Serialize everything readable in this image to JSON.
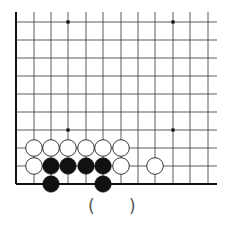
{
  "diagram": {
    "type": "go-board-problem",
    "grid": {
      "columns": 12,
      "rows": 10,
      "x_positions": [
        16,
        34,
        51,
        68,
        86,
        103,
        121,
        138,
        155,
        173,
        190,
        208
      ],
      "y_positions": [
        22,
        40,
        58,
        76,
        94,
        112,
        130,
        148,
        166,
        184
      ],
      "line_extend_right": 217,
      "line_extend_top": 12,
      "left_edge_border": true,
      "bottom_edge_border": true,
      "line_color": "#333333",
      "border_color": "#111111"
    },
    "star_points": [
      {
        "col": 3,
        "row": 0
      },
      {
        "col": 9,
        "row": 0
      },
      {
        "col": 3,
        "row": 6
      },
      {
        "col": 9,
        "row": 6
      }
    ],
    "stones": [
      {
        "color": "white",
        "col": 1,
        "row": 7
      },
      {
        "color": "white",
        "col": 2,
        "row": 7
      },
      {
        "color": "white",
        "col": 3,
        "row": 7
      },
      {
        "color": "white",
        "col": 4,
        "row": 7
      },
      {
        "color": "white",
        "col": 5,
        "row": 7
      },
      {
        "color": "white",
        "col": 6,
        "row": 7
      },
      {
        "color": "white",
        "col": 1,
        "row": 8
      },
      {
        "color": "black",
        "col": 2,
        "row": 8
      },
      {
        "color": "black",
        "col": 3,
        "row": 8
      },
      {
        "color": "black",
        "col": 4,
        "row": 8
      },
      {
        "color": "black",
        "col": 5,
        "row": 8
      },
      {
        "color": "white",
        "col": 6,
        "row": 8
      },
      {
        "color": "white",
        "col": 8,
        "row": 8
      },
      {
        "color": "black",
        "col": 2,
        "row": 9
      },
      {
        "color": "black",
        "col": 5,
        "row": 9
      }
    ],
    "stone_radius": 8.3,
    "colors": {
      "black_stone": "#111111",
      "white_stone": "#ffffff",
      "white_stone_outline": "#222222"
    }
  },
  "caption": {
    "open_paren": "(",
    "close_paren": ")"
  }
}
